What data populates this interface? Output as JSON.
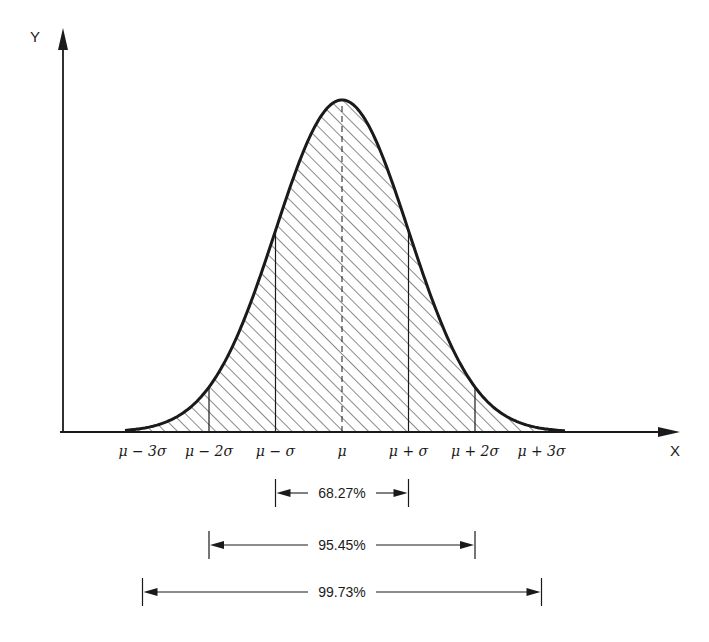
{
  "diagram": {
    "axes": {
      "x_label": "X",
      "y_label": "Y"
    },
    "mean_px": 342,
    "sigma_px": 66.5,
    "peak_y_px": 100,
    "baseline_y_px": 432,
    "x_ticks": [
      {
        "key": "m3",
        "label": "μ − 3σ",
        "k": -3,
        "tick_line": false
      },
      {
        "key": "m2",
        "label": "μ − 2σ",
        "k": -2,
        "tick_line": true
      },
      {
        "key": "m1",
        "label": "μ − σ",
        "k": -1,
        "tick_line": true
      },
      {
        "key": "mu",
        "label": "μ",
        "k": 0,
        "tick_line": true,
        "dashed": true
      },
      {
        "key": "p1",
        "label": "μ + σ",
        "k": 1,
        "tick_line": true
      },
      {
        "key": "p2",
        "label": "μ + 2σ",
        "k": 2,
        "tick_line": true
      },
      {
        "key": "p3",
        "label": "μ + 3σ",
        "k": 3,
        "tick_line": false
      }
    ],
    "intervals": [
      {
        "key": "one_sigma",
        "label": "68.27%",
        "k": 1,
        "y_px": 493
      },
      {
        "key": "two_sigma",
        "label": "95.45%",
        "k": 2,
        "y_px": 545
      },
      {
        "key": "three_sigma",
        "label": "99.73%",
        "k": 3,
        "y_px": 592
      }
    ],
    "hatch": "diagonal",
    "colors": {
      "ink": "#1a1a1a",
      "background": "#ffffff"
    }
  }
}
